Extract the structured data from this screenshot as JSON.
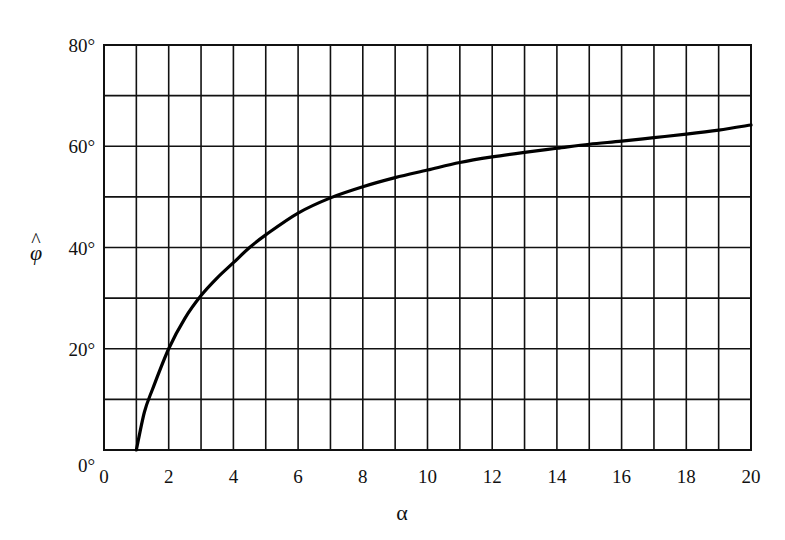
{
  "chart_data": {
    "type": "line",
    "title": "",
    "xlabel": "α",
    "ylabel": "φ̂",
    "xlim": [
      0,
      20
    ],
    "ylim": [
      0,
      80
    ],
    "grid": true,
    "grid_x_step": 1,
    "grid_y_step": 10,
    "legend": null,
    "x_ticks": [
      0,
      2,
      4,
      6,
      8,
      10,
      12,
      14,
      16,
      18,
      20
    ],
    "x_tick_labels": [
      "0",
      "2",
      "4",
      "6",
      "8",
      "10",
      "12",
      "14",
      "16",
      "18",
      "20"
    ],
    "y_ticks": [
      0,
      20,
      40,
      60,
      80
    ],
    "y_tick_labels": [
      "0°",
      "20°",
      "40°",
      "60°",
      "80°"
    ],
    "series": [
      {
        "name": "φ̂ vs α",
        "color": "#000000",
        "x": [
          1,
          1.25,
          1.5,
          2,
          2.5,
          3,
          3.5,
          4,
          4.5,
          5,
          6,
          7,
          8,
          9,
          10,
          11,
          12,
          13,
          14,
          15,
          16,
          17,
          18,
          19,
          20
        ],
        "y": [
          0,
          7.5,
          12,
          20,
          26,
          30.5,
          34,
          37,
          40,
          42.5,
          46.8,
          49.8,
          52,
          53.8,
          55.3,
          56.8,
          57.9,
          58.8,
          59.6,
          60.4,
          61,
          61.7,
          62.4,
          63.2,
          64.2
        ]
      }
    ]
  },
  "axes": {
    "x_label": "α",
    "y_label_base": "φ",
    "y_label_hat": "^"
  },
  "colors": {
    "line": "#000000",
    "grid": "#111111",
    "background": "#ffffff"
  }
}
